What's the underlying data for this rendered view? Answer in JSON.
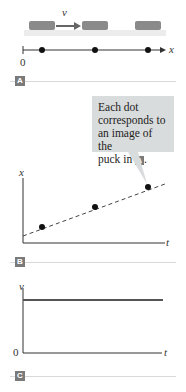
{
  "panel_a": {
    "label": "A",
    "velocity_label": "v⃗",
    "axis_label": "x",
    "origin_label": "0",
    "puck_count": 3,
    "dot_count": 3
  },
  "callout": {
    "text_line1": "Each dot",
    "text_line2": "corresponds to",
    "text_line3": "an image of the",
    "text_line4": "puck in",
    "ref_label": "A",
    "trailing": "."
  },
  "panel_b": {
    "label": "B",
    "y_axis_label": "x",
    "x_axis_label": "t"
  },
  "panel_c": {
    "label": "C",
    "y_axis_label": "v",
    "x_axis_label": "t",
    "origin_label": "0"
  },
  "colors": {
    "puck": "#8a8a8a",
    "surface": "#e8e8e8",
    "badge": "#7a7a7a",
    "callout_bg": "#d9dcdc",
    "line": "#444444"
  }
}
